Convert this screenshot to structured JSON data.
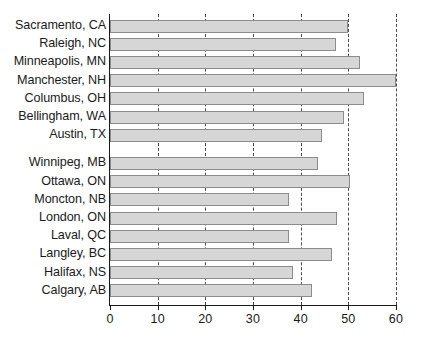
{
  "chart_data": {
    "type": "bar",
    "orientation": "horizontal",
    "title": "",
    "xlabel": "",
    "ylabel": "",
    "xlim": [
      0,
      60
    ],
    "ylim": null,
    "grid": true,
    "grid_axis": "x",
    "grid_style": "dashed",
    "legend": null,
    "xticks": [
      0,
      10,
      20,
      30,
      40,
      50,
      60
    ],
    "xtick_labels": [
      "0",
      "10",
      "20",
      "30",
      "40",
      "50",
      "60"
    ],
    "bar_fill_color": "#d6d6d6",
    "bar_edge_color": "#8c8c8c",
    "axis_color": "#1a1a1a",
    "background_color": "#ffffff",
    "groups": [
      {
        "name": "United States",
        "categories": [
          "Sacramento, CA",
          "Raleigh, NC",
          "Minneapolis, MN",
          "Manchester, NH",
          "Columbus, OH",
          "Bellingham, WA",
          "Austin, TX"
        ],
        "values": [
          50.0,
          47.5,
          52.4,
          60.0,
          53.3,
          49.1,
          44.4
        ]
      },
      {
        "name": "Canada",
        "categories": [
          "Winnipeg, MB",
          "Ottawa, ON",
          "Moncton, NB",
          "London, ON",
          "Laval, QC",
          "Langley, BC",
          "Halifax, NS",
          "Calgary, AB"
        ],
        "values": [
          43.7,
          50.3,
          37.6,
          47.7,
          37.6,
          46.5,
          38.4,
          42.3
        ]
      }
    ],
    "categories": [
      "Sacramento, CA",
      "Raleigh, NC",
      "Minneapolis, MN",
      "Manchester, NH",
      "Columbus, OH",
      "Bellingham, WA",
      "Austin, TX",
      "Winnipeg, MB",
      "Ottawa, ON",
      "Moncton, NB",
      "London, ON",
      "Laval, QC",
      "Langley, BC",
      "Halifax, NS",
      "Calgary, AB"
    ],
    "values": [
      50.0,
      47.5,
      52.4,
      60.0,
      53.3,
      49.1,
      44.4,
      43.7,
      50.3,
      37.6,
      47.7,
      37.6,
      46.5,
      38.4,
      42.3
    ]
  },
  "layout": {
    "plot_left_px": 110,
    "plot_top_px": 14,
    "plot_width_px": 286,
    "plot_height_px": 291,
    "bar_height_px": 13,
    "bar_pitch_px": 18.2,
    "group_gap_px": 10
  }
}
